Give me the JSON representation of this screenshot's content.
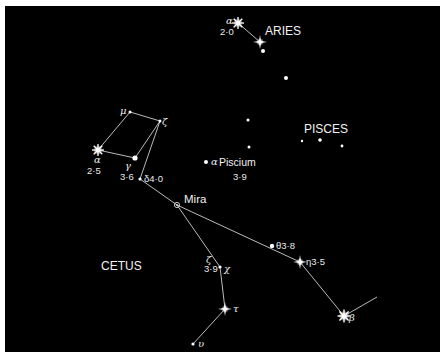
{
  "colors": {
    "background": "#000000",
    "frame": "#ffffff",
    "stars": "#ffffff",
    "lines": "#cfcfcf"
  },
  "constellations": [
    {
      "name": "ARIES",
      "x": 265,
      "y": 34
    },
    {
      "name": "PISCES",
      "x": 304,
      "y": 132
    },
    {
      "name": "CETUS",
      "x": 101,
      "y": 269
    }
  ],
  "stars": [
    {
      "id": "alpha-arietis",
      "greek": "α",
      "mag": "2·0",
      "x": 238,
      "y": 23,
      "kind": "burst"
    },
    {
      "id": "beta-arietis",
      "greek": "",
      "mag": "",
      "x": 260,
      "y": 42,
      "kind": "cross"
    },
    {
      "id": "gamma-arietis",
      "x": 263,
      "y": 51,
      "kind": "dot"
    },
    {
      "id": "aries-dim",
      "x": 286,
      "y": 78,
      "kind": "dot"
    },
    {
      "id": "pisces-1",
      "x": 248,
      "y": 120,
      "kind": "dot-small"
    },
    {
      "id": "pisces-2",
      "x": 249,
      "y": 147,
      "kind": "dot-small"
    },
    {
      "id": "pisces-3",
      "x": 302,
      "y": 141,
      "kind": "dot-small"
    },
    {
      "id": "pisces-4",
      "x": 320,
      "y": 140,
      "kind": "dot"
    },
    {
      "id": "pisces-5",
      "x": 342,
      "y": 146,
      "kind": "dot-small"
    },
    {
      "id": "alpha-piscium",
      "label": "α Piscium",
      "mag": "3·9",
      "x": 206,
      "y": 162,
      "kind": "dot"
    },
    {
      "id": "mu-ceti",
      "greek": "μ",
      "x": 130,
      "y": 112,
      "kind": "dot-small"
    },
    {
      "id": "zeta-ceti-top",
      "greek": "ζ",
      "x": 160,
      "y": 121,
      "kind": "dot-small"
    },
    {
      "id": "alpha-ceti",
      "greek": "α",
      "mag": "2·5",
      "x": 98,
      "y": 150,
      "kind": "burst"
    },
    {
      "id": "gamma-ceti",
      "greek": "γ",
      "mag": "3·6",
      "x": 135,
      "y": 158,
      "kind": "dot"
    },
    {
      "id": "delta-ceti",
      "greek": "δ",
      "mag": "4·0",
      "x": 140,
      "y": 179,
      "kind": "dot-small"
    },
    {
      "id": "mira",
      "label": "Mira",
      "x": 177,
      "y": 205,
      "kind": "variable"
    },
    {
      "id": "theta-ceti",
      "greek": "θ",
      "mag": "3·8",
      "x": 272,
      "y": 246,
      "kind": "dot"
    },
    {
      "id": "eta-ceti",
      "greek": "η",
      "mag": "3·5",
      "x": 300,
      "y": 262,
      "kind": "cross"
    },
    {
      "id": "zeta-ceti",
      "greek": "ζ",
      "mag": "3·9",
      "x": 220,
      "y": 267,
      "kind": "dot-small"
    },
    {
      "id": "chi-ceti",
      "greek": "χ",
      "x": 224,
      "y": 268,
      "kind": "none"
    },
    {
      "id": "tau-ceti",
      "greek": "τ",
      "x": 225,
      "y": 309,
      "kind": "cross"
    },
    {
      "id": "upsilon-ceti",
      "greek": "υ",
      "x": 193,
      "y": 344,
      "kind": "dot-small"
    },
    {
      "id": "beta-ceti",
      "greek": "β",
      "x": 344,
      "y": 316,
      "kind": "burst"
    }
  ],
  "labels": {
    "aries_alpha_greek": "α",
    "aries_alpha_mag": "2·0",
    "alpha_piscium_greek": "α",
    "alpha_piscium_name": "Piscium",
    "alpha_piscium_mag": "3·9",
    "mu": "μ",
    "zeta_top": "ζ",
    "alpha_ceti_greek": "α",
    "alpha_ceti_mag": "2·5",
    "gamma_greek": "γ",
    "gamma_mag": "3·6",
    "delta_label": "δ4·0",
    "mira": "Mira",
    "theta_label": "θ3·8",
    "eta_label": "η3·5",
    "zeta_greek": "ζ",
    "zeta_mag": "3·9",
    "chi": "χ",
    "tau": "τ",
    "upsilon": "υ",
    "beta": "β"
  }
}
